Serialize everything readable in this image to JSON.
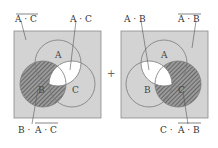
{
  "colors": {
    "universe_fill": "#d3d3d3",
    "universe_stroke": "#8a8a8a",
    "circle_stroke": "#7a7a7a",
    "highlight_fill": "#ffffff",
    "hatch_color": "#555555",
    "text": "#333333"
  },
  "operator": "+",
  "diagrams": [
    {
      "id": "left",
      "circle_labels": {
        "A": "A",
        "B": "B",
        "C": "C"
      },
      "callouts": {
        "top_left": {
          "text": "A · C",
          "overline": true,
          "target": "universe-background"
        },
        "top_right": {
          "text": "A · C",
          "overline": false,
          "target": "A-and-C-intersection"
        },
        "bottom": {
          "prefix": "B · ",
          "overlined": "A · C",
          "target": "B-hatched"
        }
      },
      "highlighted_region": "A∩C (white)",
      "hatched_region": "B minus (A∩C)"
    },
    {
      "id": "right",
      "circle_labels": {
        "A": "A",
        "B": "B",
        "C": "C"
      },
      "callouts": {
        "top_left": {
          "text": "A · B",
          "overline": false,
          "target": "A-and-B-intersection"
        },
        "top_right": {
          "text": "A · B",
          "overline": true,
          "target": "universe-background"
        },
        "bottom": {
          "prefix": "C · ",
          "overlined": "A · B",
          "target": "C-hatched"
        }
      },
      "highlighted_region": "A∩B (white)",
      "hatched_region": "C minus (A∩B)"
    }
  ],
  "text": {
    "left_top_left": "A · C",
    "left_top_right": "A · C",
    "left_bottom_prefix": "B · ",
    "left_bottom_over": "A · C",
    "right_top_left": "A · B",
    "right_top_right": "A · B",
    "right_bottom_prefix": "C · ",
    "right_bottom_over": "A · B",
    "label_A": "A",
    "label_B": "B",
    "label_C": "C",
    "plus": "+"
  }
}
